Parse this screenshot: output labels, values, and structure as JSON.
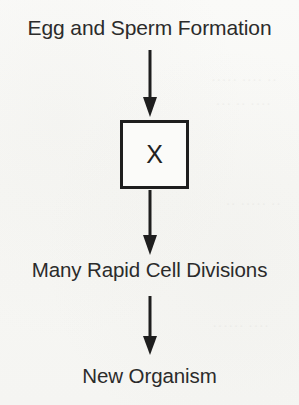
{
  "diagram": {
    "type": "flowchart",
    "orientation": "vertical",
    "title_node": "Egg and Sperm Formation",
    "process_box_label": "X",
    "divisions_node": "Many Rapid Cell Divisions",
    "organism_node": "New Organism",
    "arrow_1_name": "arrow-down-1",
    "arrow_2_name": "arrow-down-2",
    "arrow_3_name": "arrow-down-3",
    "colors": {
      "background": "#f8f8f6",
      "text": "#2b2b2b",
      "stroke": "#1e1e1e",
      "box_fill": "#fbfbf9"
    }
  },
  "background_bleed": {
    "line1": "·· ···· ·····",
    "line2": "···· ·· ···",
    "line3": "·· ····· ··",
    "line4": "···· ······"
  }
}
